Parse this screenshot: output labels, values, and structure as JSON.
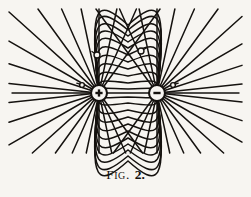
{
  "figure": {
    "caption_prefix": "F",
    "caption_smallcaps": "IG",
    "caption_sep": ".",
    "caption_number": "2.",
    "caption_full": "FIG. 2.",
    "background_color": "#f7f5f1",
    "ink_color": "#15120f",
    "width": 251,
    "height": 197
  },
  "chart_data": {
    "type": "diagram",
    "subtype": "electric-dipole-field-lines",
    "xlabel": "",
    "ylabel": "",
    "grid": false,
    "legend": "none",
    "charges": [
      {
        "name": "positive-charge",
        "sign": "+",
        "label": "+",
        "x": 99,
        "y": 93,
        "radius": 8.0,
        "inner_radius": 5.2
      },
      {
        "name": "negative-charge",
        "sign": "-",
        "label": "−",
        "x": 157,
        "y": 93,
        "radius": 8.0,
        "inner_radius": 5.2
      }
    ],
    "axis_line": {
      "y": 93,
      "x_start": 12,
      "x_end": 239
    },
    "dipole_arcs": {
      "count_upper": 11,
      "count_lower": 11,
      "peak_heights_upper": [
        89,
        83,
        76,
        69,
        62,
        55,
        48,
        42,
        36,
        30,
        25
      ],
      "peak_heights_lower": [
        97,
        103,
        110,
        117,
        124,
        131,
        138,
        144,
        150,
        156,
        161
      ],
      "note": "heights are the apex y coordinate of each nested arc joining the two charges"
    },
    "radial_lines": {
      "per_side": 11,
      "angles_deg_from_axis": [
        6,
        18,
        30,
        42,
        54,
        66,
        78,
        90,
        102,
        114,
        126
      ],
      "note": "straight lines fanning out from each charge toward the figure border"
    },
    "point_markers": [
      {
        "name": "marker-left",
        "x": 97,
        "y": 55,
        "radius": 3.0,
        "tick_angle_deg": 215
      },
      {
        "name": "marker-right",
        "x": 141,
        "y": 51,
        "radius": 3.0,
        "tick_angle_deg": 330
      },
      {
        "name": "marker-axis-left",
        "x": 82,
        "y": 85,
        "radius": 2.4,
        "tick_angle_deg": 200
      },
      {
        "name": "marker-axis-right",
        "x": 173,
        "y": 85,
        "radius": 2.4,
        "tick_angle_deg": 340
      }
    ]
  }
}
